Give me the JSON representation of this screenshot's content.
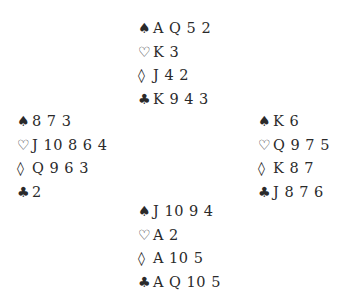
{
  "diagram": {
    "north": {
      "spades": "A Q 5 2",
      "hearts": "K 3",
      "diamonds": "J 4 2",
      "clubs": "K 9 4 3"
    },
    "west": {
      "spades": "8 7 3",
      "hearts": "J 10 8 6 4",
      "diamonds": "Q 9 6 3",
      "clubs": "2"
    },
    "east": {
      "spades": "K 6",
      "hearts": "Q 9 7 5",
      "diamonds": "K 8 7",
      "clubs": "J 8 7 6"
    },
    "south": {
      "spades": "J 10 9 4",
      "hearts": "A 2",
      "diamonds": "A 10 5",
      "clubs": "A Q 10 5"
    }
  },
  "suits": {
    "spades": "♠",
    "hearts": "♡",
    "diamonds": "◊",
    "clubs": "♣"
  }
}
